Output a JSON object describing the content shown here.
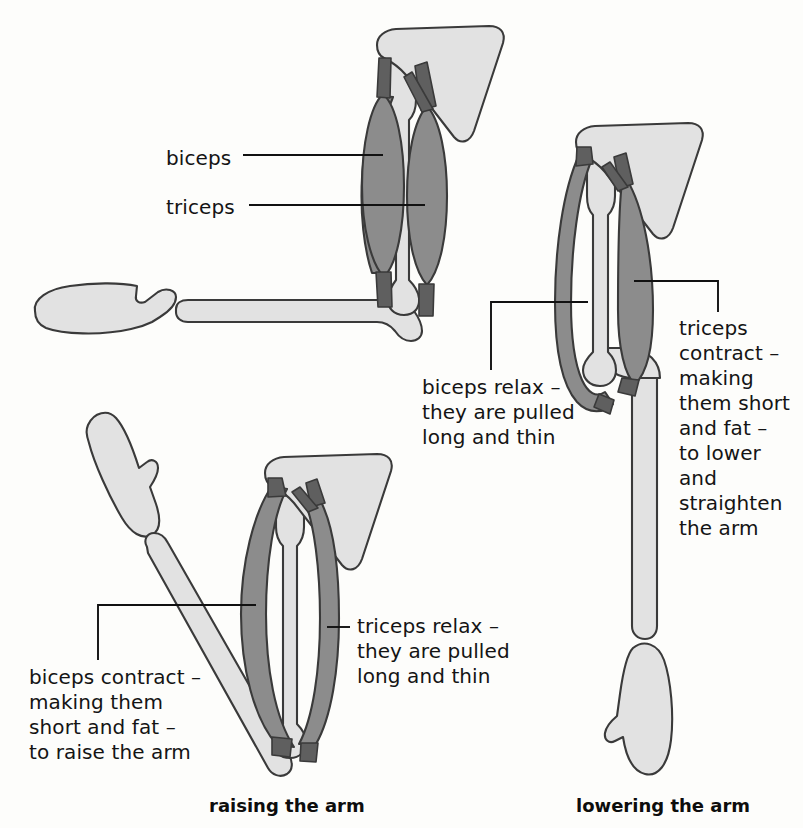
{
  "figure": {
    "type": "anatomical-diagram",
    "background_color": "#fdfdfb",
    "colors": {
      "muscle_fill": "#8c8c8c",
      "muscle_dark": "#5f5f5f",
      "bone_fill": "#e2e2e2",
      "outline": "#3a3a3a",
      "text": "#141414"
    }
  },
  "labels": {
    "biceps": "biceps",
    "triceps": "triceps",
    "biceps_relax": "biceps relax –\nthey are pulled\nlong and thin",
    "triceps_contract": "triceps\ncontract –\nmaking\nthem short\nand fat –\nto lower\nand\nstraighten\nthe arm",
    "triceps_relax": "triceps relax –\nthey are pulled\nlong and thin",
    "biceps_contract": "biceps contract –\nmaking them\nshort and fat –\nto raise the arm"
  },
  "captions": {
    "raising": "raising the arm",
    "lowering": "lowering the arm"
  },
  "panels": [
    {
      "id": "reference",
      "position": "top-left",
      "caption": null,
      "description": "arm bent at right angle, hand detached at left; biceps and triceps both shown at rest",
      "callouts": [
        "biceps",
        "triceps"
      ]
    },
    {
      "id": "raising",
      "position": "bottom-left",
      "caption": "raising the arm",
      "description": "forearm raised diagonally; biceps short and fat, triceps long and thin",
      "callouts": [
        "biceps_contract",
        "triceps_relax"
      ]
    },
    {
      "id": "lowering",
      "position": "right",
      "caption": "lowering the arm",
      "description": "forearm straight and lowered; triceps short and fat, biceps long and thin",
      "callouts": [
        "biceps_relax",
        "triceps_contract"
      ]
    }
  ]
}
